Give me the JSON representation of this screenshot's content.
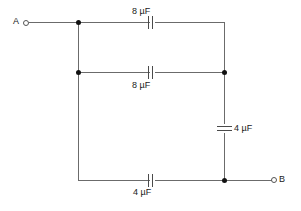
{
  "diagram": {
    "type": "capacitor-network-circuit",
    "background_color": "#ffffff",
    "wire_color": "#6b6b6b",
    "node_color": "#111111",
    "text_color": "#1a1a1a",
    "terminals": [
      {
        "id": "A",
        "label": "A",
        "position": "left"
      },
      {
        "id": "B",
        "label": "B",
        "position": "right"
      }
    ],
    "components": [
      {
        "id": "c-top",
        "label": "8 µF",
        "value": 8,
        "unit": "µF",
        "orientation": "horizontal",
        "branch": "top"
      },
      {
        "id": "c-middle",
        "label": "8 µF",
        "value": 8,
        "unit": "µF",
        "orientation": "horizontal",
        "branch": "middle"
      },
      {
        "id": "c-right",
        "label": "4 µF",
        "value": 4,
        "unit": "µF",
        "orientation": "vertical",
        "branch": "right"
      },
      {
        "id": "c-bottom",
        "label": "4 µF",
        "value": 4,
        "unit": "µF",
        "orientation": "horizontal",
        "branch": "bottom"
      }
    ],
    "junction_count": 4
  }
}
